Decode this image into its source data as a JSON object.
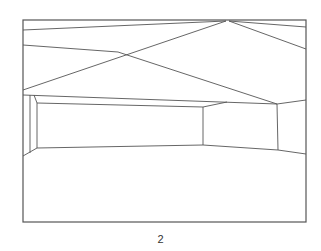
{
  "figure": {
    "caption": "2",
    "stroke_color": "#555555",
    "frame": {
      "x": 23,
      "y": 20,
      "width": 283,
      "height": 202
    },
    "lines": [
      {
        "name": "ceiling-line-top-left",
        "x1": 23,
        "y1": 30,
        "x2": 226,
        "y2": 21
      },
      {
        "name": "ceiling-line-top-right",
        "x1": 229,
        "y1": 21,
        "x2": 306,
        "y2": 27
      },
      {
        "name": "ceiling-line-apex-right",
        "x1": 229,
        "y1": 21,
        "x2": 306,
        "y2": 49
      },
      {
        "name": "ceiling-line-apex-left-diag",
        "x1": 226,
        "y1": 21,
        "x2": 23,
        "y2": 90
      },
      {
        "name": "ceiling-line-mid-left",
        "x1": 23,
        "y1": 45,
        "x2": 118,
        "y2": 52
      },
      {
        "name": "ceiling-line-mid-diag",
        "x1": 118,
        "y1": 52,
        "x2": 277,
        "y2": 104
      },
      {
        "name": "ceiling-edge-back",
        "x1": 23,
        "y1": 95,
        "x2": 277,
        "y2": 104
      },
      {
        "name": "ceiling-edge-right",
        "x1": 277,
        "y1": 104,
        "x2": 306,
        "y2": 100
      },
      {
        "name": "back-wall-top",
        "x1": 37,
        "y1": 103,
        "x2": 203,
        "y2": 107
      },
      {
        "name": "back-wall-top-right",
        "x1": 203,
        "y1": 107,
        "x2": 227,
        "y2": 102
      },
      {
        "name": "back-wall-left-slant",
        "x1": 34,
        "y1": 95,
        "x2": 37,
        "y2": 103
      },
      {
        "name": "left-wall-inner-vertical",
        "x1": 30,
        "y1": 95,
        "x2": 30,
        "y2": 153
      },
      {
        "name": "back-wall-left-vertical",
        "x1": 37,
        "y1": 103,
        "x2": 37,
        "y2": 148
      },
      {
        "name": "back-wall-right-vertical",
        "x1": 203,
        "y1": 107,
        "x2": 203,
        "y2": 145
      },
      {
        "name": "right-wall-vertical",
        "x1": 277,
        "y1": 104,
        "x2": 278,
        "y2": 150
      },
      {
        "name": "floor-left-slope",
        "x1": 23,
        "y1": 156,
        "x2": 37,
        "y2": 148
      },
      {
        "name": "floor-back-edge",
        "x1": 37,
        "y1": 148,
        "x2": 203,
        "y2": 145
      },
      {
        "name": "floor-right-edge",
        "x1": 203,
        "y1": 145,
        "x2": 278,
        "y2": 150
      },
      {
        "name": "floor-right-edge-ext",
        "x1": 278,
        "y1": 150,
        "x2": 306,
        "y2": 154
      }
    ]
  }
}
